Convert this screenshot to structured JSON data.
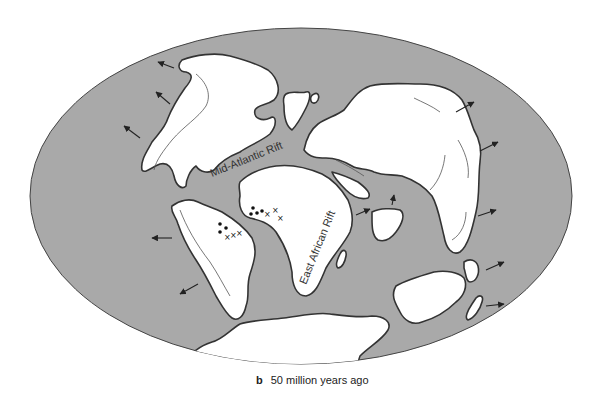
{
  "figure": {
    "caption_letter": "b",
    "caption_text": "50 million years ago",
    "labels": {
      "mid_atlantic": "Mid-Atlantic Rift",
      "east_african": "East African Rift"
    },
    "colors": {
      "ocean": "#a9a9a9",
      "land": "#ffffff",
      "outline": "#333333"
    },
    "symbols": {
      "dots": "•",
      "crosses": "×"
    }
  }
}
